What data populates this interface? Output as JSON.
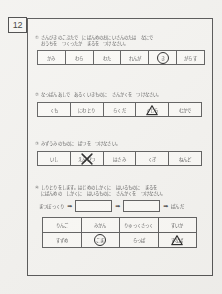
{
  "page": {
    "number": "12"
  },
  "sections": [
    {
      "num": "①",
      "prompt_line1": "さんびきのこぶたで　にばんめのおにいさんのたは　なにで",
      "prompt_line2": "おうちを　つくったか　まるを　つけなさい。",
      "cells": [
        {
          "word": "かみ",
          "mark": "none"
        },
        {
          "word": "わら",
          "mark": "none"
        },
        {
          "word": "わた",
          "mark": "none"
        },
        {
          "word": "れんが",
          "mark": "none"
        },
        {
          "word": "き",
          "mark": "circle"
        },
        {
          "word": "がらす",
          "mark": "none"
        }
      ]
    },
    {
      "num": "②",
      "prompt_line1": "なっぱんあしで　あるくいきものに　さんかくを　つけなさい。",
      "prompt_line2": "",
      "cells": [
        {
          "word": "くも",
          "mark": "none"
        },
        {
          "word": "にわとり",
          "mark": "none"
        },
        {
          "word": "らくだ",
          "mark": "none"
        },
        {
          "word": "くじら",
          "mark": "triangle"
        },
        {
          "word": "むかで",
          "mark": "none"
        }
      ]
    },
    {
      "num": "③",
      "prompt_line1": "みずうみのものに　ばつを　つけなさい。",
      "prompt_line2": "",
      "cells": [
        {
          "word": "いし",
          "mark": "none"
        },
        {
          "word": "えんぴつ",
          "mark": "x"
        },
        {
          "word": "はさみ",
          "mark": "none"
        },
        {
          "word": "くぎ",
          "mark": "none"
        },
        {
          "word": "ねんど",
          "mark": "none"
        }
      ]
    },
    {
      "num": "④",
      "prompt_line1": "しりとりをします。はじめのしかくに　はいるものに　まるを",
      "prompt_line2": "にばんめの　しかくに　はいるものに　さんかくを　つけなさい。",
      "cells": []
    }
  ],
  "chain": {
    "start_word": "まつぼっくり",
    "end_word": "ぱんだ",
    "arrow_glyph": "➡",
    "blank1_value": "",
    "blank2_value": ""
  },
  "answer_grid": {
    "rows": [
      [
        {
          "word": "りんご",
          "mark": "none"
        },
        {
          "word": "みかん",
          "mark": "none"
        },
        {
          "word": "りゅっくさっく",
          "mark": "none"
        },
        {
          "word": "すいか",
          "mark": "none"
        }
      ],
      [
        {
          "word": "すずめ",
          "mark": "none"
        },
        {
          "word": "こま",
          "mark": "circle"
        },
        {
          "word": "らっぱ",
          "mark": "none"
        },
        {
          "word": "すなば",
          "mark": "triangle"
        }
      ]
    ]
  },
  "colors": {
    "paper": "#f2f1ee",
    "ink": "#4a4a4a",
    "rule": "#555555",
    "mark": "#1c1c1c"
  }
}
